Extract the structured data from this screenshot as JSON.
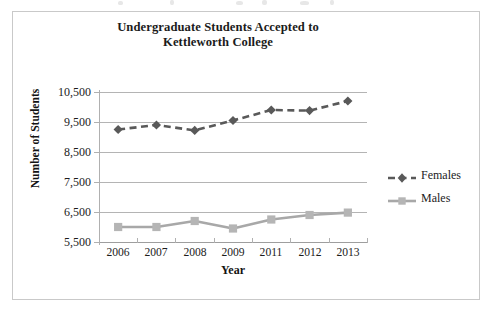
{
  "chart_frame": {
    "border_color": "#c9c9c9",
    "background": "#ffffff"
  },
  "title": {
    "line1": "Undergraduate Students Accepted to",
    "line2": "Kettleworth College"
  },
  "axes": {
    "x_title": "Year",
    "y_title": "Number of Students",
    "y_tick_labels": [
      "10,500",
      "9,500",
      "8,500",
      "7,500",
      "6,500",
      "5,500"
    ],
    "x_tick_labels": [
      "2006",
      "2007",
      "2008",
      "2009",
      "2011",
      "2012",
      "2013"
    ]
  },
  "legend": {
    "position": "right",
    "items": [
      {
        "label": "Females",
        "color": "#595959",
        "marker": "diamond-marker",
        "line_style": "dashed"
      },
      {
        "label": "Males",
        "color": "#a8a8a8",
        "marker": "square-marker",
        "line_style": "solid"
      }
    ]
  },
  "chart_data": {
    "type": "line",
    "title": "Undergraduate Students Accepted to Kettleworth College",
    "xlabel": "Year",
    "ylabel": "Number of Students",
    "categories": [
      "2006",
      "2007",
      "2008",
      "2009",
      "2011",
      "2012",
      "2013"
    ],
    "ylim": [
      5500,
      10500
    ],
    "y_ticks": [
      5500,
      6500,
      7500,
      8500,
      9500,
      10500
    ],
    "grid": "horizontal",
    "legend_position": "right",
    "series": [
      {
        "name": "Females",
        "color": "#595959",
        "line_style": "dashed",
        "marker": "diamond",
        "values": [
          9250,
          9400,
          9220,
          9550,
          9900,
          9880,
          10200
        ]
      },
      {
        "name": "Males",
        "color": "#a8a8a8",
        "line_style": "solid",
        "marker": "square",
        "values": [
          6000,
          6000,
          6200,
          5950,
          6250,
          6400,
          6480
        ]
      }
    ]
  }
}
